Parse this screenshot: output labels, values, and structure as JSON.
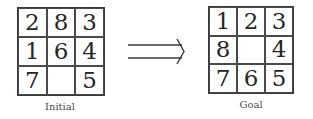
{
  "diagram": {
    "initial": {
      "label": "Initial",
      "tiles": [
        "2",
        "8",
        "3",
        "1",
        "6",
        "4",
        "7",
        "",
        "5"
      ]
    },
    "goal": {
      "label": "Goal",
      "tiles": [
        "1",
        "2",
        "3",
        "8",
        "",
        "4",
        "7",
        "6",
        "5"
      ]
    },
    "arrow": {
      "icon": "double-right-arrow-icon",
      "color": "#3a3a3a"
    }
  }
}
